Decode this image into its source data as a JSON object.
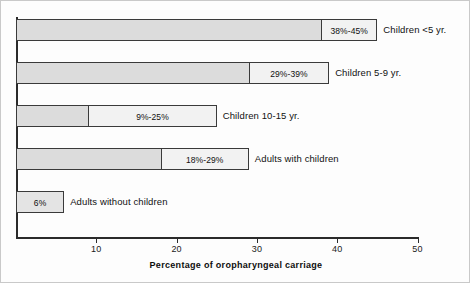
{
  "chart_data": {
    "type": "bar",
    "orientation": "horizontal",
    "title": "",
    "xlabel": "Percentage of oropharyngeal carriage",
    "ylabel": "",
    "xlim": [
      0,
      50
    ],
    "xticks": [
      10,
      20,
      30,
      40,
      50
    ],
    "xtick_labels": [
      "10",
      "20",
      "30",
      "40",
      "50"
    ],
    "grid": false,
    "legend": false,
    "categories": [
      "Children <5 yr.",
      "Children 5-9 yr.",
      "Children 10-15 yr.",
      "Adults with children",
      "Adults without children"
    ],
    "series": [
      {
        "name": "Range low",
        "values": [
          38,
          29,
          9,
          18,
          6
        ]
      },
      {
        "name": "Range high",
        "values": [
          45,
          39,
          25,
          29,
          6
        ]
      }
    ],
    "bars": [
      {
        "category": "Children <5 yr.",
        "low": 38,
        "high": 45,
        "range_label": "38%-45%",
        "category_label": "Children <5 yr."
      },
      {
        "category": "Children 5-9 yr.",
        "low": 29,
        "high": 39,
        "range_label": "29%-39%",
        "category_label": "Children 5-9 yr."
      },
      {
        "category": "Children 10-15 yr.",
        "low": 9,
        "high": 25,
        "range_label": "9%-25%",
        "category_label": "Children 10-15 yr."
      },
      {
        "category": "Adults with children",
        "low": 18,
        "high": 29,
        "range_label": "18%-29%",
        "category_label": "Adults with children"
      },
      {
        "category": "Adults without children",
        "low": 6,
        "high": 6,
        "range_label": "6%",
        "category_label": "Adults without children"
      }
    ],
    "colors": {
      "bar_low_fill": "#dcdcdc",
      "bar_high_fill": "#f2f2f2",
      "bar_border": "#3a3a3a",
      "axis": "#2b2b2b",
      "text": "#111111",
      "background": "#fdfdfd"
    }
  },
  "geometry": {
    "origin_x": 15,
    "px_per_unit": 8.03,
    "bar_height": 22,
    "row_pitch": 43,
    "first_row_top": 18,
    "axis_y": 236
  }
}
